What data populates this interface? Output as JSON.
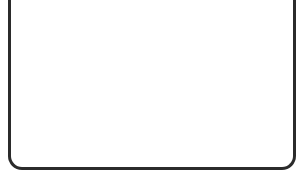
{
  "chart_data": {
    "type": "line",
    "title": "",
    "xlabel": "x",
    "ylabel": "y",
    "xlim": [
      0,
      15.5
    ],
    "ylim": [
      0,
      8.5
    ],
    "x_ticks": [
      "1",
      "2",
      "3",
      "4",
      "5",
      "6",
      "7",
      "8",
      "9",
      "10",
      "11",
      "12",
      "13",
      "14",
      "15"
    ],
    "y_ticks": [
      "1",
      "2",
      "3",
      "4",
      "5",
      "6",
      "7",
      "8"
    ],
    "origin_label": "0",
    "grid": true,
    "series": [
      {
        "name": "2x + 5y = 30",
        "x": [
          0,
          15
        ],
        "y": [
          6,
          0
        ]
      }
    ],
    "annotations": [
      {
        "text": "(0,6)",
        "x": 0,
        "y": 6
      },
      {
        "text": "(15,0)",
        "x": 15,
        "y": 0
      },
      {
        "text": "2x + 5y = 30",
        "x": 7.5,
        "y": 3.6
      }
    ]
  },
  "colors": {
    "line": "#1a1a1a",
    "grid_major": "#b8b8b8",
    "grid_minor": "#e2e2e2",
    "frame": "#2b2b2b"
  }
}
